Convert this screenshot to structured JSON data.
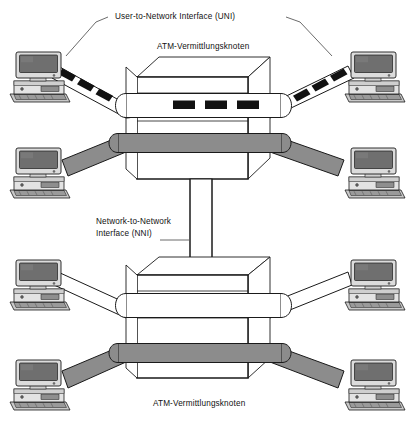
{
  "diagram": {
    "title_top_interface": "User-to-Network Interface (UNI)",
    "label_switch_top": "ATM-Vermittlungsknoten",
    "label_switch_bottom": "ATM-Vermittlungsknoten",
    "label_trunk_interface": "Network-to-Network Interface (NNI)",
    "label_trunk_line1": "Network-to-Network",
    "label_trunk_line2": "Interface (NNI)"
  },
  "colors": {
    "line": "#1a1a1a",
    "pipe_fill_white": "#ffffff",
    "pipe_fill_gray": "#8c8c8c",
    "cell_fill": "#111111",
    "monitor_screen": "#6f6f6f",
    "case_body": "#d9d9d9",
    "text": "#111111"
  },
  "nodes": {
    "switch_top": {
      "name": "ATM switching node (top)",
      "cells_in_white_pipe": 3
    },
    "switch_bottom": {
      "name": "ATM switching node (bottom)",
      "cells_in_white_pipe": 0
    }
  },
  "workstations": [
    {
      "id": "pc-top-left",
      "position": "top-left",
      "link_type": "cell-pipe"
    },
    {
      "id": "pc-top-right",
      "position": "top-right",
      "link_type": "cell-pipe"
    },
    {
      "id": "pc-mid-left",
      "position": "middle-left",
      "link_type": "gray-pipe"
    },
    {
      "id": "pc-mid-right",
      "position": "middle-right",
      "link_type": "gray-pipe"
    },
    {
      "id": "pc-low-left",
      "position": "lower-left",
      "link_type": "white-pipe"
    },
    {
      "id": "pc-low-right",
      "position": "lower-right",
      "link_type": "white-pipe"
    },
    {
      "id": "pc-bottom-left",
      "position": "bottom-left",
      "link_type": "gray-pipe"
    },
    {
      "id": "pc-bottom-right",
      "position": "bottom-right",
      "link_type": "gray-pipe"
    }
  ],
  "cells": {
    "top_left_link_cells": 3,
    "top_right_link_cells": 3,
    "switch_top_cells": 3
  }
}
